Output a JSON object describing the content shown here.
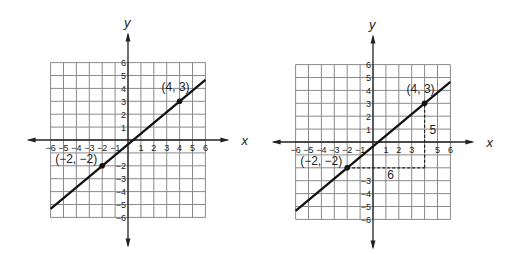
{
  "graphs": [
    {
      "id": "left",
      "axes": {
        "x_label": "x",
        "y_label": "y",
        "range": [
          -6,
          6
        ]
      },
      "x_ticks": [
        "−6",
        "−5",
        "−4",
        "−3",
        "−2",
        "−1",
        "1",
        "2",
        "3",
        "4",
        "5",
        "6"
      ],
      "y_ticks": [
        "6",
        "5",
        "4",
        "3",
        "2",
        "1",
        "−2",
        "−3",
        "−4",
        "−5",
        "−6"
      ],
      "points": [
        {
          "x": 4,
          "y": 3,
          "label": "(4, 3)"
        },
        {
          "x": -2,
          "y": -2,
          "label": "(−2, −2)"
        }
      ],
      "line": {
        "from": [
          -6,
          -5.333
        ],
        "to": [
          6,
          4.667
        ]
      }
    },
    {
      "id": "right",
      "axes": {
        "x_label": "x",
        "y_label": "y",
        "range": [
          -6,
          6
        ]
      },
      "x_ticks": [
        "−6",
        "−5",
        "−4",
        "−3",
        "−2",
        "−1",
        "1",
        "2",
        "3",
        "5",
        "6"
      ],
      "y_ticks": [
        "6",
        "5",
        "4",
        "3",
        "2",
        "1",
        "−3",
        "−4",
        "−5",
        "−6"
      ],
      "points": [
        {
          "x": 4,
          "y": 3,
          "label": "(4, 3)"
        },
        {
          "x": -2,
          "y": -2,
          "label": "(−2, −2)"
        }
      ],
      "line": {
        "from": [
          -6,
          -5.333
        ],
        "to": [
          6,
          4.667
        ]
      },
      "rise_run": {
        "rise_label": "5",
        "run_label": "6"
      }
    }
  ],
  "chart_data": [
    {
      "type": "line",
      "title": "",
      "xlabel": "x",
      "ylabel": "y",
      "xlim": [
        -6,
        6
      ],
      "ylim": [
        -6,
        6
      ],
      "grid": true,
      "series": [
        {
          "name": "line",
          "x": [
            -2,
            4
          ],
          "y": [
            -2,
            3
          ]
        }
      ],
      "annotations": [
        "(4, 3)",
        "(−2, −2)"
      ]
    },
    {
      "type": "line",
      "title": "",
      "xlabel": "x",
      "ylabel": "y",
      "xlim": [
        -6,
        6
      ],
      "ylim": [
        -6,
        6
      ],
      "grid": true,
      "series": [
        {
          "name": "line",
          "x": [
            -2,
            4
          ],
          "y": [
            -2,
            3
          ]
        }
      ],
      "annotations": [
        "(4, 3)",
        "(−2, −2)",
        "rise 5",
        "run 6"
      ]
    }
  ]
}
